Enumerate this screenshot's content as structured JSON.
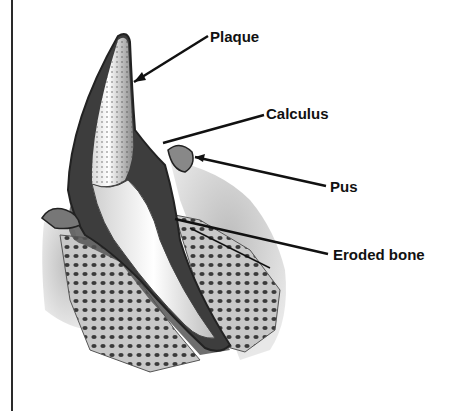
{
  "diagram": {
    "labels": [
      {
        "id": "plaque",
        "text": "Plaque"
      },
      {
        "id": "calculus",
        "text": "Calculus"
      },
      {
        "id": "pus",
        "text": "Pus"
      },
      {
        "id": "eroded_bone",
        "text": "Eroded bone"
      }
    ]
  }
}
